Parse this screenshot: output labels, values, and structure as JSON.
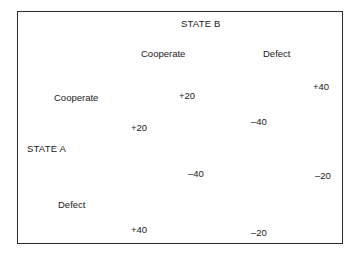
{
  "figure": {
    "type": "payoff-matrix",
    "row_player_title": "STATE A",
    "column_player_title": "STATE B",
    "column_headers": [
      "Cooperate",
      "Defect"
    ],
    "row_headers": [
      "Cooperate",
      "Defect"
    ],
    "border_color": "#2b2b2b",
    "text_color": "#1a1a1a",
    "background_color": "#ffffff"
  },
  "chart_data": {
    "type": "table",
    "title": "",
    "row_player": "STATE A",
    "column_player": "STATE B",
    "categories": [
      "Cooperate",
      "Defect"
    ],
    "cells": [
      {
        "row": "Cooperate",
        "column": "Cooperate",
        "row_player_payoff": "+20",
        "column_player_payoff": "+20"
      },
      {
        "row": "Cooperate",
        "column": "Defect",
        "row_player_payoff": "–40",
        "column_player_payoff": "+40"
      },
      {
        "row": "Defect",
        "column": "Cooperate",
        "row_player_payoff": "+40",
        "column_player_payoff": "–40"
      },
      {
        "row": "Defect",
        "column": "Defect",
        "row_player_payoff": "–20",
        "column_player_payoff": "–20"
      }
    ]
  }
}
